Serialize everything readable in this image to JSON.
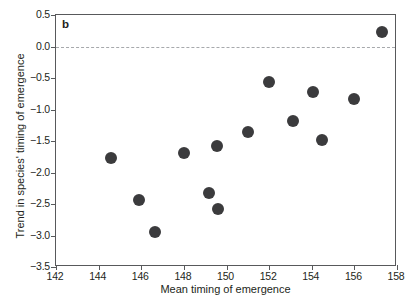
{
  "chart_data": {
    "type": "scatter",
    "title": "",
    "panel_label": "b",
    "xlabel": "Mean timing of emergence",
    "ylabel": "Trend in species' timing of emergence",
    "xlim": [
      142,
      158
    ],
    "ylim": [
      -3.5,
      0.5
    ],
    "xticks": [
      142,
      144,
      146,
      148,
      150,
      152,
      154,
      156,
      158
    ],
    "xticklabels": [
      "142",
      "144",
      "146",
      "148",
      "150",
      "152",
      "154",
      "156",
      "158"
    ],
    "yticks": [
      0.5,
      0.0,
      -0.5,
      -1.0,
      -1.5,
      -2.0,
      -2.5,
      -3.0,
      -3.5
    ],
    "yticklabels": [
      "0.5",
      "0.0",
      "-0.5",
      "-1.0",
      "-1.5",
      "-2.0",
      "-2.5",
      "-3.0",
      "-3.5"
    ],
    "grid": false,
    "legend": null,
    "reference_lines": [
      {
        "name": "zero-line",
        "axis": "y",
        "value": 0.0,
        "style": "dashed",
        "color": "#a7a9ac"
      }
    ],
    "marker": {
      "shape": "circle",
      "color": "#3b3b3d",
      "size_px": 12
    },
    "points": [
      {
        "x": 144.6,
        "y": -1.77
      },
      {
        "x": 145.9,
        "y": -2.44
      },
      {
        "x": 146.65,
        "y": -2.95
      },
      {
        "x": 148.0,
        "y": -1.69
      },
      {
        "x": 149.2,
        "y": -2.33
      },
      {
        "x": 149.55,
        "y": -1.58
      },
      {
        "x": 149.6,
        "y": -2.58
      },
      {
        "x": 151.0,
        "y": -1.35
      },
      {
        "x": 152.0,
        "y": -0.57
      },
      {
        "x": 153.1,
        "y": -1.19
      },
      {
        "x": 154.05,
        "y": -0.73
      },
      {
        "x": 154.5,
        "y": -1.49
      },
      {
        "x": 156.0,
        "y": -0.83
      },
      {
        "x": 157.3,
        "y": 0.23
      }
    ]
  }
}
